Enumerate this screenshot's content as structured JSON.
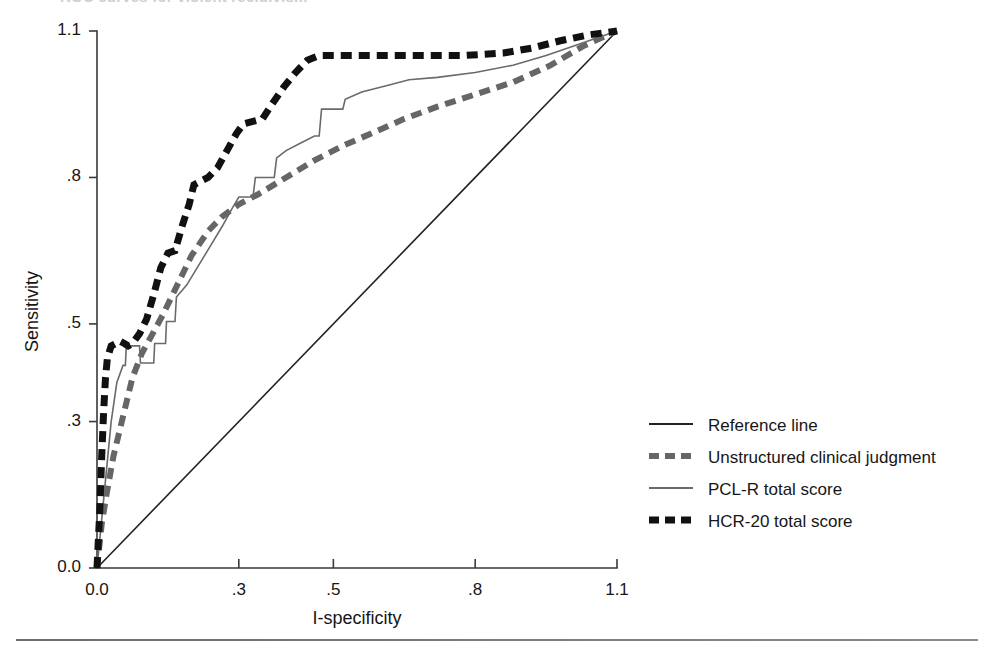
{
  "figure": {
    "title_cut_off": "ROC curves for violent recidivism"
  },
  "chart_data": {
    "type": "line",
    "title": "",
    "xlabel": "I-specificity",
    "ylabel": "Sensitivity",
    "xlim": [
      0.0,
      1.1
    ],
    "ylim": [
      0.0,
      1.1
    ],
    "grid": false,
    "legend_position": "right",
    "x_ticks": [
      "0.0",
      ".3",
      ".5",
      ".8",
      "1.1"
    ],
    "x_tick_values": [
      0.0,
      0.3,
      0.5,
      0.8,
      1.1
    ],
    "y_ticks": [
      "0.0",
      ".3",
      ".5",
      ".8",
      "1.1"
    ],
    "y_tick_values": [
      0.0,
      0.3,
      0.5,
      0.8,
      1.1
    ],
    "series": [
      {
        "name": "Reference line",
        "style": "solid",
        "color": "#222222",
        "width": 1.6,
        "points": [
          [
            0.0,
            0.0
          ],
          [
            1.1,
            1.1
          ]
        ]
      },
      {
        "name": "Unstructured clinical judgment",
        "style": "dashed",
        "color": "#666666",
        "width": 6,
        "points": [
          [
            0.0,
            0.0
          ],
          [
            0.01,
            0.09
          ],
          [
            0.02,
            0.15
          ],
          [
            0.035,
            0.23
          ],
          [
            0.055,
            0.31
          ],
          [
            0.075,
            0.39
          ],
          [
            0.095,
            0.44
          ],
          [
            0.115,
            0.475
          ],
          [
            0.14,
            0.52
          ],
          [
            0.17,
            0.58
          ],
          [
            0.2,
            0.64
          ],
          [
            0.235,
            0.69
          ],
          [
            0.265,
            0.72
          ],
          [
            0.3,
            0.745
          ],
          [
            0.34,
            0.765
          ],
          [
            0.4,
            0.8
          ],
          [
            0.46,
            0.835
          ],
          [
            0.52,
            0.865
          ],
          [
            0.58,
            0.89
          ],
          [
            0.65,
            0.92
          ],
          [
            0.72,
            0.945
          ],
          [
            0.8,
            0.97
          ],
          [
            0.88,
            0.995
          ],
          [
            0.96,
            1.03
          ],
          [
            1.03,
            1.07
          ],
          [
            1.1,
            1.1
          ]
        ]
      },
      {
        "name": "PCL-R total score",
        "style": "solid",
        "color": "#6a6a6a",
        "width": 1.6,
        "points": [
          [
            0.0,
            0.0
          ],
          [
            0.012,
            0.12
          ],
          [
            0.02,
            0.2
          ],
          [
            0.03,
            0.3
          ],
          [
            0.042,
            0.38
          ],
          [
            0.055,
            0.415
          ],
          [
            0.06,
            0.415
          ],
          [
            0.062,
            0.455
          ],
          [
            0.09,
            0.455
          ],
          [
            0.092,
            0.42
          ],
          [
            0.12,
            0.42
          ],
          [
            0.122,
            0.46
          ],
          [
            0.145,
            0.46
          ],
          [
            0.147,
            0.505
          ],
          [
            0.165,
            0.505
          ],
          [
            0.168,
            0.555
          ],
          [
            0.19,
            0.58
          ],
          [
            0.215,
            0.62
          ],
          [
            0.24,
            0.66
          ],
          [
            0.265,
            0.7
          ],
          [
            0.285,
            0.735
          ],
          [
            0.3,
            0.76
          ],
          [
            0.33,
            0.76
          ],
          [
            0.335,
            0.8
          ],
          [
            0.375,
            0.8
          ],
          [
            0.38,
            0.84
          ],
          [
            0.4,
            0.855
          ],
          [
            0.43,
            0.87
          ],
          [
            0.46,
            0.885
          ],
          [
            0.47,
            0.885
          ],
          [
            0.475,
            0.94
          ],
          [
            0.52,
            0.94
          ],
          [
            0.525,
            0.96
          ],
          [
            0.56,
            0.975
          ],
          [
            0.62,
            0.99
          ],
          [
            0.66,
            1.0
          ],
          [
            0.72,
            1.005
          ],
          [
            0.8,
            1.015
          ],
          [
            0.88,
            1.03
          ],
          [
            0.95,
            1.05
          ],
          [
            1.01,
            1.07
          ],
          [
            1.1,
            1.1
          ]
        ]
      },
      {
        "name": "HCR-20 total score",
        "style": "dashed",
        "color": "#111111",
        "width": 7,
        "points": [
          [
            0.0,
            0.0
          ],
          [
            0.006,
            0.12
          ],
          [
            0.01,
            0.23
          ],
          [
            0.014,
            0.32
          ],
          [
            0.018,
            0.39
          ],
          [
            0.022,
            0.43
          ],
          [
            0.03,
            0.455
          ],
          [
            0.04,
            0.46
          ],
          [
            0.048,
            0.465
          ],
          [
            0.058,
            0.46
          ],
          [
            0.066,
            0.455
          ],
          [
            0.075,
            0.46
          ],
          [
            0.09,
            0.48
          ],
          [
            0.105,
            0.51
          ],
          [
            0.12,
            0.56
          ],
          [
            0.135,
            0.615
          ],
          [
            0.15,
            0.645
          ],
          [
            0.165,
            0.65
          ],
          [
            0.18,
            0.7
          ],
          [
            0.195,
            0.745
          ],
          [
            0.205,
            0.785
          ],
          [
            0.215,
            0.79
          ],
          [
            0.235,
            0.8
          ],
          [
            0.255,
            0.82
          ],
          [
            0.275,
            0.855
          ],
          [
            0.295,
            0.89
          ],
          [
            0.31,
            0.91
          ],
          [
            0.33,
            0.915
          ],
          [
            0.35,
            0.92
          ],
          [
            0.37,
            0.95
          ],
          [
            0.395,
            0.985
          ],
          [
            0.42,
            1.015
          ],
          [
            0.445,
            1.04
          ],
          [
            0.47,
            1.05
          ],
          [
            0.54,
            1.05
          ],
          [
            0.62,
            1.05
          ],
          [
            0.7,
            1.05
          ],
          [
            0.78,
            1.05
          ],
          [
            0.86,
            1.055
          ],
          [
            0.92,
            1.065
          ],
          [
            0.98,
            1.08
          ],
          [
            1.04,
            1.092
          ],
          [
            1.1,
            1.1
          ]
        ]
      }
    ]
  },
  "legend": {
    "items": [
      {
        "label": "Reference line",
        "style": "solid",
        "color": "#222222",
        "width": 1.8
      },
      {
        "label": "Unstructured clinical judgment",
        "style": "dashed",
        "color": "#666666",
        "width": 6
      },
      {
        "label": "PCL-R total score",
        "style": "solid",
        "color": "#6a6a6a",
        "width": 1.8
      },
      {
        "label": "HCR-20 total score",
        "style": "dashed",
        "color": "#111111",
        "width": 7
      }
    ]
  }
}
